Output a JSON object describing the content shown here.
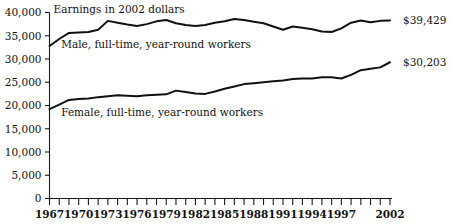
{
  "chart_data": {
    "type": "line",
    "title": "Earnings in 2002 dollars",
    "xlabel": "",
    "ylabel": "",
    "ylim": [
      0,
      40000
    ],
    "yticks": [
      0,
      5000,
      10000,
      15000,
      20000,
      25000,
      30000,
      35000,
      40000
    ],
    "ytick_labels": [
      "0",
      "5,000",
      "10,000",
      "15,000",
      "20,000",
      "25,000",
      "30,000",
      "35,000",
      "40,000"
    ],
    "grid": false,
    "legend_position": "inline-annotations",
    "x": [
      1967,
      1968,
      1969,
      1970,
      1971,
      1972,
      1973,
      1974,
      1975,
      1976,
      1977,
      1978,
      1979,
      1980,
      1981,
      1982,
      1983,
      1984,
      1985,
      1986,
      1987,
      1988,
      1989,
      1990,
      1991,
      1992,
      1993,
      1994,
      1995,
      1996,
      1997,
      1998,
      1999,
      2000,
      2001,
      2002
    ],
    "xtick_labels": [
      "1967",
      "1970",
      "1973",
      "1976",
      "1979",
      "1982",
      "1985",
      "1988",
      "1991",
      "1994",
      "1997",
      "2002"
    ],
    "xtick_years": [
      1967,
      1970,
      1973,
      1976,
      1979,
      1982,
      1985,
      1988,
      1991,
      1994,
      1997,
      2002
    ],
    "series": [
      {
        "name": "Male, full-time, year-round workers",
        "label_x": 1968.2,
        "label_y": 32400,
        "end_value_label": "$39,429",
        "values": [
          32800,
          34300,
          35600,
          35700,
          35800,
          36300,
          38200,
          37800,
          37400,
          37100,
          37500,
          38100,
          38400,
          37700,
          37300,
          37100,
          37300,
          37800,
          38100,
          38600,
          38400,
          38000,
          37700,
          37000,
          36300,
          37000,
          36700,
          36400,
          35900,
          35800,
          36600,
          37800,
          38300,
          37900,
          38200,
          38300
        ]
      },
      {
        "name": "Female, full-time, year-round workers",
        "label_x": 1968.2,
        "label_y": 17700,
        "end_value_label": "$30,203",
        "values": [
          19200,
          20200,
          21200,
          21400,
          21500,
          21800,
          22000,
          22200,
          22100,
          22000,
          22200,
          22300,
          22400,
          23200,
          22900,
          22600,
          22500,
          23000,
          23600,
          24100,
          24600,
          24800,
          25000,
          25200,
          25400,
          25700,
          25800,
          25800,
          26100,
          26100,
          25800,
          26600,
          27600,
          27900,
          28200,
          29300
        ]
      }
    ],
    "right_annotations": [
      {
        "text": "$39,429",
        "series": "male"
      },
      {
        "text": "$30,203",
        "series": "female"
      }
    ]
  }
}
